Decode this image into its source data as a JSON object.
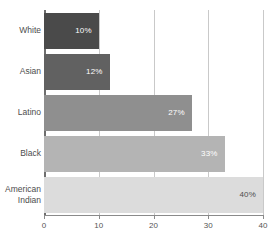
{
  "chart_data": {
    "type": "bar",
    "orientation": "horizontal",
    "title": "",
    "subtitle": "",
    "xlabel": "",
    "ylabel": "",
    "categories": [
      "White",
      "Asian",
      "Latino",
      "Black",
      "American Indian"
    ],
    "values": [
      10,
      12,
      27,
      33,
      40
    ],
    "data_labels": [
      "10%",
      "12%",
      "27%",
      "33%",
      "40%"
    ],
    "bar_colors": [
      "#4a4a4a",
      "#616161",
      "#8f8f8f",
      "#b4b4b4",
      "#dcdcdc"
    ],
    "label_colors": [
      "#ffffff",
      "#ffffff",
      "#ffffff",
      "#ffffff",
      "#4d4d4d"
    ],
    "xlim": [
      0,
      40
    ],
    "xticks": [
      0,
      10,
      20,
      30,
      40
    ],
    "xtick_labels": [
      "0",
      "10",
      "20",
      "30",
      "40"
    ],
    "grid": true,
    "grid_axis": "x",
    "grid_color": "#c9c9c9",
    "axis_color": "#6e6e6e",
    "legend": false,
    "background": "#ffffff",
    "category_label_lines": [
      [
        "White"
      ],
      [
        "Asian"
      ],
      [
        "Latino"
      ],
      [
        "Black"
      ],
      [
        "American",
        "Indian"
      ]
    ]
  }
}
